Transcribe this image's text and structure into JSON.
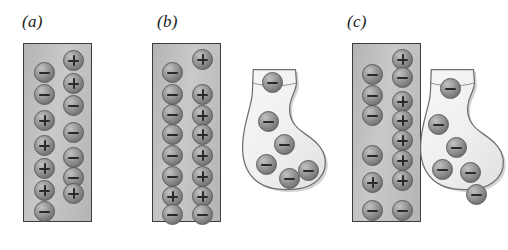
{
  "figure": {
    "width": 508,
    "height": 250,
    "background_color": "#ffffff"
  },
  "style": {
    "slab_fill_light": "#c9c9c9",
    "slab_fill_dark": "#b4b4b4",
    "slab_border": "#3c3c3c",
    "sphere_fill": "#8c8c8c",
    "sphere_rim": "#5a5a5a",
    "sphere_highlight": "#c2c2c2",
    "glyph_color": "#2a2a2a",
    "sock_fill": "#efefef",
    "sock_outline": "#6e6e6e",
    "label_color": "#1a1a1a"
  },
  "panels": [
    {
      "id": "a",
      "label": "(a)",
      "label_x": 22,
      "label_y": 12,
      "slab": {
        "x": 23,
        "y": 43,
        "width": 69,
        "height": 179
      },
      "has_sock": false,
      "charges": [
        {
          "sign": "+",
          "x": 63,
          "y": 50
        },
        {
          "sign": "-",
          "x": 34,
          "y": 62
        },
        {
          "sign": "+",
          "x": 63,
          "y": 73
        },
        {
          "sign": "-",
          "x": 34,
          "y": 84
        },
        {
          "sign": "-",
          "x": 63,
          "y": 95
        },
        {
          "sign": "+",
          "x": 34,
          "y": 110
        },
        {
          "sign": "-",
          "x": 63,
          "y": 122
        },
        {
          "sign": "+",
          "x": 34,
          "y": 135
        },
        {
          "sign": "-",
          "x": 63,
          "y": 147
        },
        {
          "sign": "+",
          "x": 34,
          "y": 158
        },
        {
          "sign": "-",
          "x": 63,
          "y": 167
        },
        {
          "sign": "+",
          "x": 34,
          "y": 180
        },
        {
          "sign": "+",
          "x": 63,
          "y": 183
        },
        {
          "sign": "-",
          "x": 34,
          "y": 201
        }
      ]
    },
    {
      "id": "b",
      "label": "(b)",
      "label_x": 157,
      "label_y": 12,
      "slab": {
        "x": 152,
        "y": 43,
        "width": 69,
        "height": 179
      },
      "has_sock": true,
      "charges": [
        {
          "sign": "+",
          "x": 192,
          "y": 49
        },
        {
          "sign": "-",
          "x": 162,
          "y": 62
        },
        {
          "sign": "-",
          "x": 162,
          "y": 84
        },
        {
          "sign": "+",
          "x": 192,
          "y": 84
        },
        {
          "sign": "-",
          "x": 162,
          "y": 104
        },
        {
          "sign": "+",
          "x": 192,
          "y": 105
        },
        {
          "sign": "-",
          "x": 162,
          "y": 124
        },
        {
          "sign": "+",
          "x": 192,
          "y": 124
        },
        {
          "sign": "-",
          "x": 162,
          "y": 145
        },
        {
          "sign": "+",
          "x": 192,
          "y": 145
        },
        {
          "sign": "-",
          "x": 162,
          "y": 166
        },
        {
          "sign": "+",
          "x": 192,
          "y": 166
        },
        {
          "sign": "+",
          "x": 162,
          "y": 186
        },
        {
          "sign": "+",
          "x": 192,
          "y": 186
        },
        {
          "sign": "-",
          "x": 162,
          "y": 204
        },
        {
          "sign": "-",
          "x": 192,
          "y": 204
        }
      ],
      "sock": {
        "x": 236,
        "y": 64,
        "width": 96,
        "height": 133,
        "charges": [
          {
            "sign": "-",
            "x": 26,
            "y": 8
          },
          {
            "sign": "-",
            "x": 22,
            "y": 47
          },
          {
            "sign": "-",
            "x": 38,
            "y": 70
          },
          {
            "sign": "-",
            "x": 20,
            "y": 90
          },
          {
            "sign": "-",
            "x": 43,
            "y": 104
          },
          {
            "sign": "-",
            "x": 62,
            "y": 96
          }
        ]
      }
    },
    {
      "id": "c",
      "label": "(c)",
      "label_x": 347,
      "label_y": 12,
      "slab": {
        "x": 352,
        "y": 43,
        "width": 69,
        "height": 179
      },
      "has_sock": true,
      "charges": [
        {
          "sign": "+",
          "x": 392,
          "y": 49
        },
        {
          "sign": "-",
          "x": 362,
          "y": 64
        },
        {
          "sign": "-",
          "x": 392,
          "y": 67
        },
        {
          "sign": "-",
          "x": 362,
          "y": 85
        },
        {
          "sign": "+",
          "x": 392,
          "y": 91
        },
        {
          "sign": "-",
          "x": 362,
          "y": 105
        },
        {
          "sign": "+",
          "x": 392,
          "y": 110
        },
        {
          "sign": "+",
          "x": 392,
          "y": 130
        },
        {
          "sign": "+",
          "x": 392,
          "y": 150
        },
        {
          "sign": "-",
          "x": 362,
          "y": 145
        },
        {
          "sign": "+",
          "x": 392,
          "y": 170
        },
        {
          "sign": "+",
          "x": 362,
          "y": 172
        },
        {
          "sign": "-",
          "x": 362,
          "y": 200
        },
        {
          "sign": "-",
          "x": 392,
          "y": 200
        }
      ],
      "sock": {
        "x": 414,
        "y": 64,
        "width": 96,
        "height": 133,
        "charges": [
          {
            "sign": "-",
            "x": 26,
            "y": 14
          },
          {
            "sign": "-",
            "x": 14,
            "y": 50
          },
          {
            "sign": "-",
            "x": 32,
            "y": 73
          },
          {
            "sign": "-",
            "x": 18,
            "y": 95
          },
          {
            "sign": "-",
            "x": 46,
            "y": 98
          },
          {
            "sign": "-",
            "x": 52,
            "y": 120
          }
        ]
      }
    }
  ]
}
